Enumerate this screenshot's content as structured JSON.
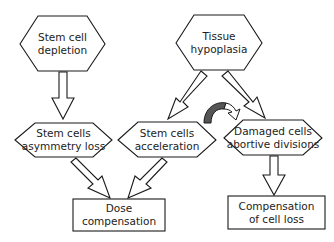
{
  "diagram": {
    "nodes": [
      {
        "id": "stem-cell-depletion",
        "shape": "hexagon",
        "label": "Stem cell\ndepletion"
      },
      {
        "id": "tissue-hypoplasia",
        "shape": "hexagon",
        "label": "Tissue\nhypoplasia"
      },
      {
        "id": "stem-cells-asymmetry-loss",
        "shape": "hexagon",
        "label": "Stem cells\nasymmetry loss"
      },
      {
        "id": "stem-cells-acceleration",
        "shape": "hexagon",
        "label": "Stem cells\nacceleration"
      },
      {
        "id": "damaged-cells-abortive-divisions",
        "shape": "hexagon",
        "label": "Damaged cells\nabortive divisions"
      },
      {
        "id": "dose-compensation",
        "shape": "rectangle",
        "label": "Dose\ncompensation"
      },
      {
        "id": "compensation-of-cell-loss",
        "shape": "rectangle",
        "label": "Compensation\nof cell loss"
      }
    ],
    "edges": [
      {
        "from": "stem-cell-depletion",
        "to": "stem-cells-asymmetry-loss",
        "style": "hollow-block-arrow"
      },
      {
        "from": "tissue-hypoplasia",
        "to": "stem-cells-acceleration",
        "style": "hollow-block-arrow"
      },
      {
        "from": "tissue-hypoplasia",
        "to": "damaged-cells-abortive-divisions",
        "style": "hollow-block-arrow"
      },
      {
        "from": "stem-cells-asymmetry-loss",
        "to": "dose-compensation",
        "style": "hollow-block-arrow"
      },
      {
        "from": "stem-cells-acceleration",
        "to": "dose-compensation",
        "style": "hollow-block-arrow"
      },
      {
        "from": "damaged-cells-abortive-divisions",
        "to": "compensation-of-cell-loss",
        "style": "hollow-block-arrow"
      },
      {
        "from": "stem-cells-acceleration",
        "to": "damaged-cells-abortive-divisions",
        "style": "curved-arrow"
      }
    ],
    "colors": {
      "stroke": "#1a1a1a",
      "fill": "#ffffff",
      "curved_arrow_fill": "#555555",
      "text": "#222222"
    }
  }
}
